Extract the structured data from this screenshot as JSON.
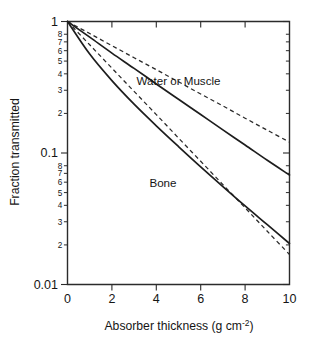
{
  "figure": {
    "background_color": "#ffffff",
    "ink_color": "#1a1a1a"
  },
  "axes": {
    "y_title": "Fraction transmitted",
    "x_title_main": "Absorber thickness (g cm",
    "x_title_sup": "-2",
    "x_title_tail": ")",
    "x_title_full": "Absorber thickness (g cm^-2)"
  },
  "annotations": {
    "water_or_muscle": "Water or Muscle",
    "bone": "Bone"
  },
  "chart_data": {
    "type": "line",
    "title": "",
    "subtitle": "",
    "xlabel": "Absorber thickness (g cm^-2)",
    "ylabel": "Fraction transmitted",
    "xlim": [
      0,
      10
    ],
    "ylim": [
      0.01,
      1
    ],
    "yscale": "log",
    "xscale": "linear",
    "grid": false,
    "legend_position": "inline-annotations",
    "xticks": [
      0,
      2,
      4,
      6,
      8,
      10
    ],
    "xticklabels": [
      "0",
      "2",
      "4",
      "6",
      "8",
      "10"
    ],
    "ytick_major": [
      1,
      0.1,
      0.01
    ],
    "ytick_major_labels": [
      "1",
      "0.1",
      "0.01"
    ],
    "ytick_minor_labels": [
      "8",
      "7",
      "6",
      "5",
      "4",
      "3",
      "2"
    ],
    "ytick_minor_values_decade1": [
      0.8,
      0.7,
      0.6,
      0.5,
      0.4,
      0.3,
      0.2
    ],
    "ytick_minor_values_decade2": [
      0.08,
      0.07,
      0.06,
      0.05,
      0.04,
      0.03,
      0.02
    ],
    "annotations": [
      {
        "text": "Water or Muscle",
        "x": 5.0,
        "y": 0.33
      },
      {
        "text": "Bone",
        "x": 4.3,
        "y": 0.055
      }
    ],
    "series": [
      {
        "name": "Water or Muscle (narrow beam, exponential)",
        "style": "dashed",
        "x": [
          0,
          1,
          2,
          3,
          4,
          5,
          6,
          7,
          8,
          9,
          10
        ],
        "values": [
          1.0,
          0.81,
          0.655,
          0.53,
          0.43,
          0.348,
          0.281,
          0.228,
          0.184,
          0.149,
          0.121
        ]
      },
      {
        "name": "Water or Muscle (broad beam, build-up)",
        "style": "solid",
        "x": [
          0,
          1,
          2,
          3,
          4,
          5,
          6,
          7,
          8,
          9,
          10
        ],
        "values": [
          1.0,
          0.76,
          0.575,
          0.44,
          0.335,
          0.256,
          0.196,
          0.15,
          0.115,
          0.088,
          0.068
        ]
      },
      {
        "name": "Bone (narrow beam, exponential)",
        "style": "dashed",
        "x": [
          0,
          1,
          2,
          3,
          4,
          5,
          6,
          7,
          8,
          9,
          10
        ],
        "values": [
          1.0,
          0.665,
          0.442,
          0.294,
          0.196,
          0.13,
          0.0865,
          0.0575,
          0.0383,
          0.0254,
          0.0169
        ]
      },
      {
        "name": "Bone (broad beam, build-up)",
        "style": "solid",
        "x": [
          0,
          1,
          2,
          3,
          4,
          5,
          6,
          7,
          8,
          9,
          10
        ],
        "values": [
          1.0,
          0.565,
          0.355,
          0.235,
          0.161,
          0.112,
          0.0785,
          0.0556,
          0.0396,
          0.0285,
          0.0205
        ]
      }
    ]
  }
}
